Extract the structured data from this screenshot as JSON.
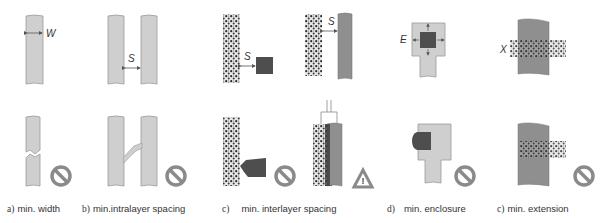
{
  "figure": {
    "panels": [
      {
        "id": "a",
        "tag": "a)",
        "caption": "min. width",
        "dimension_label": "W",
        "violation_icon": "prohibited-icon"
      },
      {
        "id": "b",
        "tag": "b)",
        "caption": "min.intralayer spacing",
        "dimension_label": "S",
        "violation_icon": "prohibited-icon"
      },
      {
        "id": "c",
        "tag": "c)",
        "caption": "min. interlayer spacing",
        "dimension_label": "S",
        "dimension_label_2": "S",
        "violation_icon": "prohibited-icon",
        "warning_icon": "warning-triangle-icon"
      },
      {
        "id": "d",
        "tag": "d)",
        "caption": "min. enclosure",
        "dimension_label": "E",
        "violation_icon": "prohibited-icon"
      },
      {
        "id": "e",
        "tag": "c)",
        "caption": "min. extension",
        "dimension_label": "X",
        "violation_icon": "prohibited-icon"
      }
    ],
    "colors": {
      "metal_light": "#c8c8c8",
      "metal_dark": "#8c8c8c",
      "via": "#505050",
      "outline": "#888888",
      "icon": "#8a8a8a"
    }
  }
}
